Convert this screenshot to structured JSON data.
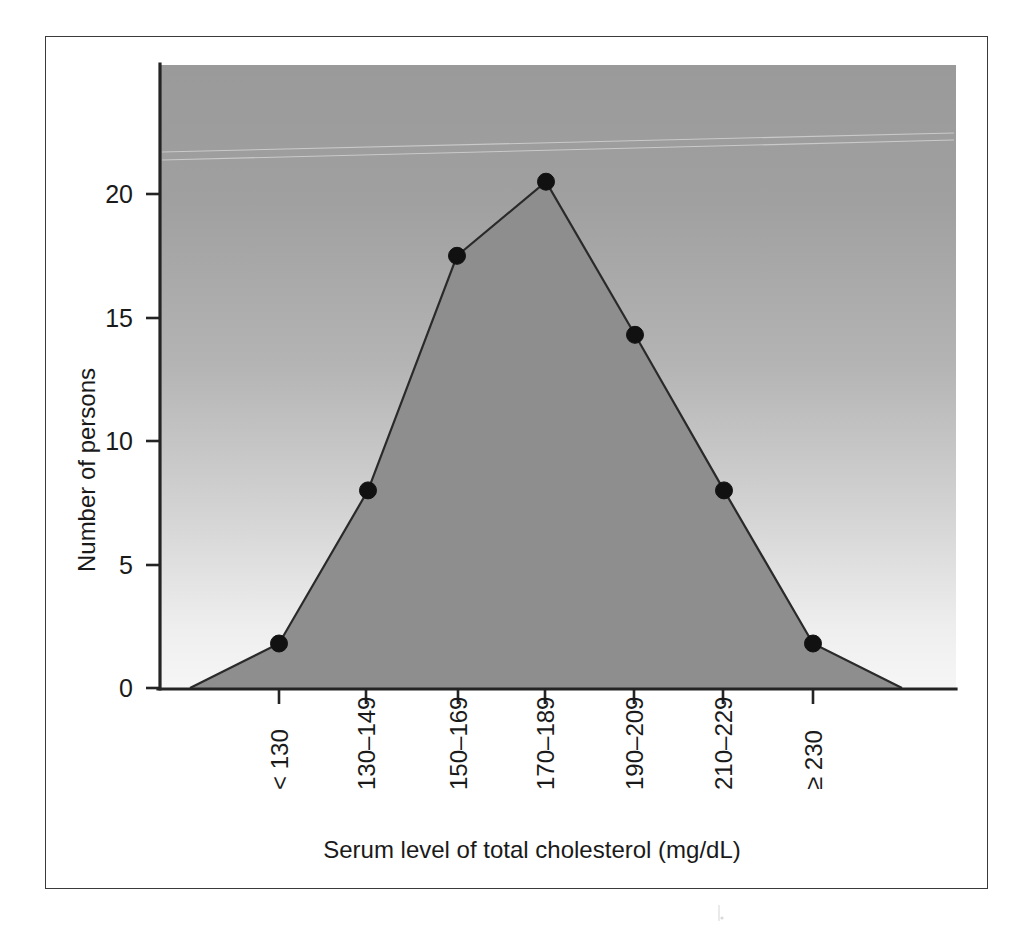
{
  "figure": {
    "kind": "frequency-polygon",
    "caption_visible": false
  },
  "axes": {
    "y_title": "Number of persons",
    "x_title": "Serum level of total cholesterol (mg/dL)",
    "y_ticks": [
      "0",
      "5",
      "10",
      "15",
      "20"
    ],
    "x_ticks": [
      "< 130",
      "130–149",
      "150–169",
      "170–189",
      "190–209",
      "210–229",
      "≥ 230"
    ]
  },
  "colors": {
    "area_fill": "#8e8e8e",
    "line_stroke": "#2a2a2a",
    "point_fill": "#111111",
    "panel_top": "#9a9a9a",
    "panel_bottom": "#f4f4f4",
    "frame_border": "#3a3a3a",
    "axis": "#242424",
    "text": "#1a1a1a"
  },
  "chart_data": {
    "type": "line",
    "title": "",
    "subtitle": "",
    "xlabel": "Serum level of total cholesterol (mg/dL)",
    "ylabel": "Number of persons",
    "categories": [
      "< 130",
      "130–149",
      "150–169",
      "170–189",
      "190–209",
      "210–229",
      "≥ 230"
    ],
    "values": [
      1.8,
      8.0,
      17.5,
      20.5,
      14.3,
      8.0,
      1.8
    ],
    "series": [
      {
        "name": "Number of persons",
        "values": [
          1.8,
          8.0,
          17.5,
          20.5,
          14.3,
          8.0,
          1.8
        ]
      }
    ],
    "anchor_left": {
      "category_index": -1,
      "value": 0
    },
    "anchor_right": {
      "category_index": 7,
      "value": 0
    },
    "ylim": [
      0,
      25
    ],
    "yticks": [
      0,
      5,
      10,
      15,
      20
    ],
    "xtick_rotation_deg": -90,
    "grid": false,
    "legend": false,
    "legend_position": "none",
    "markers": "filled-circle",
    "fill_under_curve": true
  }
}
